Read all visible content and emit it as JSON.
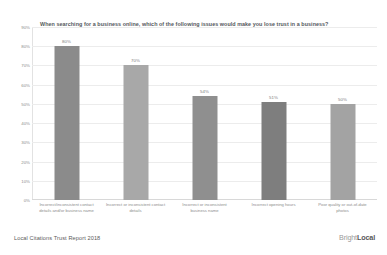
{
  "chart_data": {
    "type": "bar",
    "title": "When searching for a business online, which of the following issues would make you lose trust in a business?",
    "xlabel": "",
    "ylabel": "",
    "ylim": [
      0,
      90
    ],
    "grid": true,
    "legend": false,
    "categories": [
      "Incorrect/inconsistent contact details and/or business name",
      "Incorrect or inconsistent contact details",
      "Incorrect or inconsistent business name",
      "Incorrect opening hours",
      "Poor quality or out-of-date photos"
    ],
    "values": [
      80,
      70,
      54,
      51,
      50
    ],
    "value_labels": [
      "80%",
      "70%",
      "54%",
      "51%",
      "50%"
    ],
    "bar_colors": [
      "#8b8b8b",
      "#a8a8a8",
      "#8f8f8f",
      "#7e7e7e",
      "#a3a3a3"
    ],
    "y_ticks": [
      90,
      80,
      70,
      60,
      50,
      40,
      30,
      20,
      10,
      0
    ],
    "y_tick_labels": [
      "90%",
      "80%",
      "70%",
      "60%",
      "50%",
      "40%",
      "30%",
      "20%",
      "10%",
      "0%"
    ]
  },
  "footer": {
    "caption": "Local Citations Trust Report 2018",
    "brand_first": "Bright",
    "brand_second": "Local"
  }
}
